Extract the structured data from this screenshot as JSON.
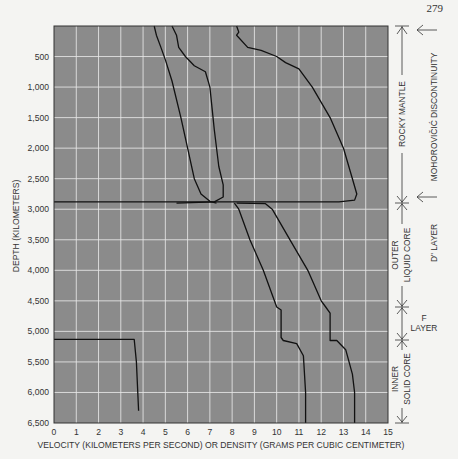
{
  "page_number": "279",
  "chart_data": {
    "type": "line",
    "title": "",
    "xlabel": "VELOCITY (KILOMETERS PER SECOND) OR DENSITY (GRAMS PER CUBIC CENTIMETER)",
    "ylabel": "DEPTH (KILOMETERS)",
    "xlim": [
      0,
      15
    ],
    "ylim": [
      6500,
      0
    ],
    "x_ticks": [
      "0",
      "1",
      "2",
      "3",
      "4",
      "5",
      "6",
      "7",
      "8",
      "9",
      "10",
      "11",
      "12",
      "13",
      "14",
      "15"
    ],
    "y_ticks": [
      "500",
      "1,000",
      "1,500",
      "2,000",
      "2,500",
      "3,000",
      "3,500",
      "4,000",
      "4,500",
      "5,000",
      "5,500",
      "6,000",
      "6,500"
    ],
    "grid": true,
    "background": "#8a8a8a",
    "grid_color": "#e8e8e8",
    "series": [
      {
        "name": "curve-1 (S-wave velocity, mantle)",
        "points": [
          [
            4.5,
            0
          ],
          [
            4.6,
            150
          ],
          [
            4.8,
            350
          ],
          [
            5.0,
            550
          ],
          [
            5.3,
            900
          ],
          [
            5.7,
            1500
          ],
          [
            6.0,
            2000
          ],
          [
            6.3,
            2500
          ],
          [
            6.6,
            2750
          ],
          [
            7.0,
            2870
          ],
          [
            7.3,
            2900
          ]
        ]
      },
      {
        "name": "curve-2 (density, mantle)",
        "points": [
          [
            5.3,
            0
          ],
          [
            5.5,
            150
          ],
          [
            5.6,
            350
          ],
          [
            5.9,
            500
          ],
          [
            6.3,
            650
          ],
          [
            6.8,
            750
          ],
          [
            7.0,
            1000
          ],
          [
            7.2,
            1700
          ],
          [
            7.4,
            2300
          ],
          [
            7.6,
            2600
          ],
          [
            7.6,
            2800
          ],
          [
            7.2,
            2880
          ],
          [
            5.5,
            2900
          ]
        ]
      },
      {
        "name": "curve-3 (P-wave velocity, mantle)",
        "points": [
          [
            8.2,
            0
          ],
          [
            8.3,
            100
          ],
          [
            8.2,
            150
          ],
          [
            8.7,
            350
          ],
          [
            9.3,
            400
          ],
          [
            10.0,
            500
          ],
          [
            10.4,
            600
          ],
          [
            11.0,
            700
          ],
          [
            11.6,
            1000
          ],
          [
            12.4,
            1500
          ],
          [
            13.0,
            2000
          ],
          [
            13.4,
            2500
          ],
          [
            13.6,
            2750
          ],
          [
            13.5,
            2850
          ],
          [
            12.8,
            2880
          ],
          [
            0,
            2880
          ]
        ]
      },
      {
        "name": "curve-4 (outer/inner core, lower)",
        "points": [
          [
            8.1,
            2900
          ],
          [
            8.3,
            3000
          ],
          [
            8.8,
            3500
          ],
          [
            9.4,
            4000
          ],
          [
            9.9,
            4500
          ],
          [
            10.0,
            4600
          ],
          [
            10.2,
            4650
          ],
          [
            10.2,
            5100
          ],
          [
            10.3,
            5150
          ],
          [
            10.9,
            5200
          ],
          [
            11.2,
            5400
          ],
          [
            11.3,
            6000
          ],
          [
            11.3,
            6500
          ]
        ]
      },
      {
        "name": "curve-5 (outer/inner core, upper)",
        "points": [
          [
            8.2,
            2900
          ],
          [
            9.5,
            2910
          ],
          [
            9.8,
            3000
          ],
          [
            10.6,
            3500
          ],
          [
            11.4,
            4000
          ],
          [
            12.0,
            4500
          ],
          [
            12.2,
            4600
          ],
          [
            12.4,
            4700
          ],
          [
            12.4,
            5150
          ],
          [
            12.7,
            5150
          ],
          [
            13.1,
            5300
          ],
          [
            13.4,
            5700
          ],
          [
            13.5,
            6000
          ],
          [
            13.5,
            6500
          ]
        ]
      },
      {
        "name": "curve-6 (inner core S-wave)",
        "points": [
          [
            0,
            5130
          ],
          [
            3.6,
            5130
          ],
          [
            3.7,
            5500
          ],
          [
            3.8,
            6300
          ]
        ]
      }
    ],
    "annotations": {
      "layers": [
        {
          "label": "ROCKY MANTLE",
          "from": 0,
          "to": 2900
        },
        {
          "label": "OUTER LIQUID CORE",
          "from": 2900,
          "to": 4600
        },
        {
          "label": "F LAYER",
          "from": 4600,
          "to": 5150
        },
        {
          "label": "INNER SOLID CORE",
          "from": 5150,
          "to": 6371
        }
      ],
      "boundaries": [
        {
          "label": "MOHOROVIČIĆ DISCONTINUITY",
          "at": 0
        },
        {
          "label": "D\" LAYER",
          "at": 2900
        }
      ]
    }
  },
  "labels": {
    "rocky_mantle": "ROCKY MANTLE",
    "moho": "MOHOROVIČIĆ DISCONTINUITY",
    "outer": "OUTER",
    "liquid_core": "LIQUID CORE",
    "d_layer": "D\" LAYER",
    "f": "F",
    "layer": "LAYER",
    "inner": "INNER",
    "solid_core": "SOLID CORE"
  }
}
